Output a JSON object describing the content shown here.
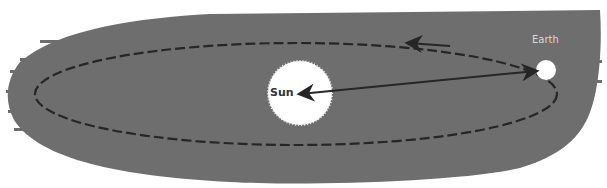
{
  "diagram": {
    "type": "orbit-diagram",
    "labels": {
      "sun": "Sun",
      "earth": "Earth"
    },
    "colors": {
      "cloud": "#6e6e6e",
      "sun": "#ffffff",
      "orbit": "#262626",
      "earth_label": "#d8d8d8"
    },
    "elements": [
      "dust cloud",
      "Sun",
      "Earth",
      "elliptical orbit (dashed)",
      "orbit direction arrow",
      "Sun-Earth double arrow"
    ]
  }
}
